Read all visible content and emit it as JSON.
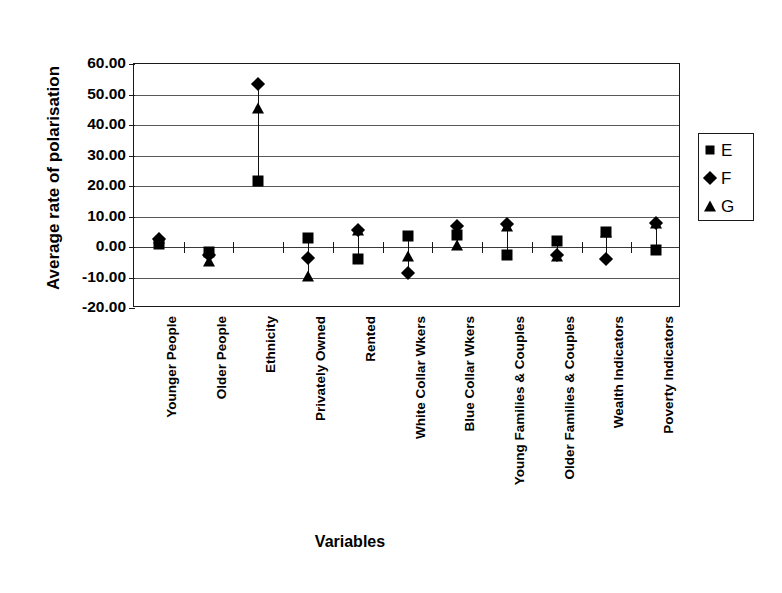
{
  "chart_data": {
    "type": "scatter",
    "title": "",
    "xlabel": "Variables",
    "ylabel": "Average rate of polarisation",
    "ylim": [
      -20,
      60
    ],
    "ytick_labels": [
      "60.00",
      "50.00",
      "40.00",
      "30.00",
      "20.00",
      "10.00",
      "0.00",
      "-10.00",
      "-20.00"
    ],
    "ytick_values": [
      60,
      50,
      40,
      30,
      20,
      10,
      0,
      -10,
      -20
    ],
    "grid": true,
    "legend_position": "right",
    "categories": [
      "Younger People",
      "Older People",
      "Ethnicity",
      "Privately Owned",
      "Rented",
      "White Collar Wkers",
      "Blue Collar Wkers",
      "Young Families & Couples",
      "Older Families & Couples",
      "Wealth Indicators",
      "Poverty Indicators"
    ],
    "series": [
      {
        "name": "E",
        "marker": "square",
        "values": [
          1.0,
          -1.5,
          21.5,
          3.0,
          -4.0,
          3.5,
          4.0,
          -2.5,
          2.0,
          5.0,
          -1.0
        ]
      },
      {
        "name": "F",
        "marker": "diamond",
        "values": [
          2.5,
          -2.5,
          53.5,
          -3.5,
          5.5,
          -8.5,
          7.0,
          7.5,
          -2.5,
          -4.0,
          8.0
        ]
      },
      {
        "name": "G",
        "marker": "triangle",
        "values": [
          3.0,
          -4.5,
          45.5,
          -9.5,
          5.5,
          -3.0,
          0.5,
          7.0,
          -3.0,
          5.0,
          8.0
        ]
      }
    ]
  },
  "legend": {
    "entries": [
      {
        "label": "E",
        "marker": "square"
      },
      {
        "label": "F",
        "marker": "diamond"
      },
      {
        "label": "G",
        "marker": "triangle"
      }
    ]
  },
  "colors": {
    "ink": "#000000",
    "grid": "#595959",
    "frame": "#1a1a1a",
    "background": "#ffffff"
  }
}
